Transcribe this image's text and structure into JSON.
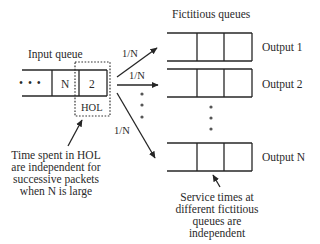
{
  "diagram": {
    "title_fictitious": "Fictitious queues",
    "title_input": "Input queue",
    "input_queue": {
      "ellipsis": "• • •",
      "cells": [
        "N",
        "2"
      ],
      "hol_label": "HOL"
    },
    "routing_probabilities": [
      "1/N",
      "1/N",
      "1/N"
    ],
    "outputs": [
      {
        "label": "Output 1"
      },
      {
        "label": "Output 2"
      },
      {
        "label": "Output N"
      }
    ],
    "notes": {
      "hol_note": [
        "Time spent in HOL",
        "are independent for",
        "successive packets",
        "when N is large"
      ],
      "service_note": [
        "Service times at",
        "different fictitious",
        "queues are",
        "independent"
      ]
    },
    "colors": {
      "line": "#262626",
      "text": "#2a2a2a",
      "background": "#ffffff"
    }
  }
}
